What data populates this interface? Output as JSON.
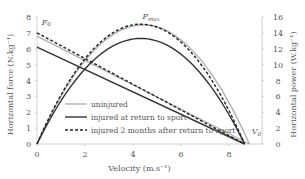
{
  "chart_data": {
    "type": "line",
    "title": "",
    "xlabel": "Velocity (m.s⁻¹)",
    "ylabel_left": "Horizontal force (N.kg⁻¹)",
    "ylabel_right": "Horizontal power (W.kg⁻¹)",
    "xlim": [
      0,
      9.375
    ],
    "ylim_left": [
      0,
      8
    ],
    "ylim_right": [
      0,
      16
    ],
    "x_ticks": [
      "0",
      "2",
      "4",
      "6",
      "8"
    ],
    "y_ticks_left": [
      "0",
      "1",
      "2",
      "3",
      "4",
      "5",
      "6",
      "7",
      "8"
    ],
    "y_ticks_right": [
      "0",
      "2",
      "4",
      "6",
      "8",
      "10",
      "12",
      "14",
      "16"
    ],
    "grid": false,
    "legend_position": "inside-lower-left",
    "annotations": [
      {
        "text": "F0",
        "sub": "0",
        "x": 0.2,
        "y": 7.5,
        "axis": "left"
      },
      {
        "text": "Pmax",
        "sub": "max",
        "x": 4.4,
        "y": 15.7,
        "axis": "right"
      },
      {
        "text": "V0",
        "sub": "0",
        "x": 8.95,
        "y": 0.6,
        "axis": "left"
      }
    ],
    "series": [
      {
        "name": "uninjured",
        "style": "solid",
        "color": "#b0b0b0",
        "F0": 6.8,
        "V0": 8.85,
        "Pmax": 15.0
      },
      {
        "name": "injured at return to sport",
        "style": "solid",
        "color": "#333333",
        "F0": 6.1,
        "V0": 8.65,
        "Pmax": 13.3
      },
      {
        "name": "injured 2 months after return to sport",
        "style": "dashed",
        "color": "#222222",
        "F0": 7.0,
        "V0": 8.65,
        "Pmax": 15.1
      }
    ]
  },
  "legend": {
    "items": [
      {
        "label": "uninjured"
      },
      {
        "label": "injured at return to sport"
      },
      {
        "label": "injured 2 months after return to sport"
      }
    ]
  }
}
